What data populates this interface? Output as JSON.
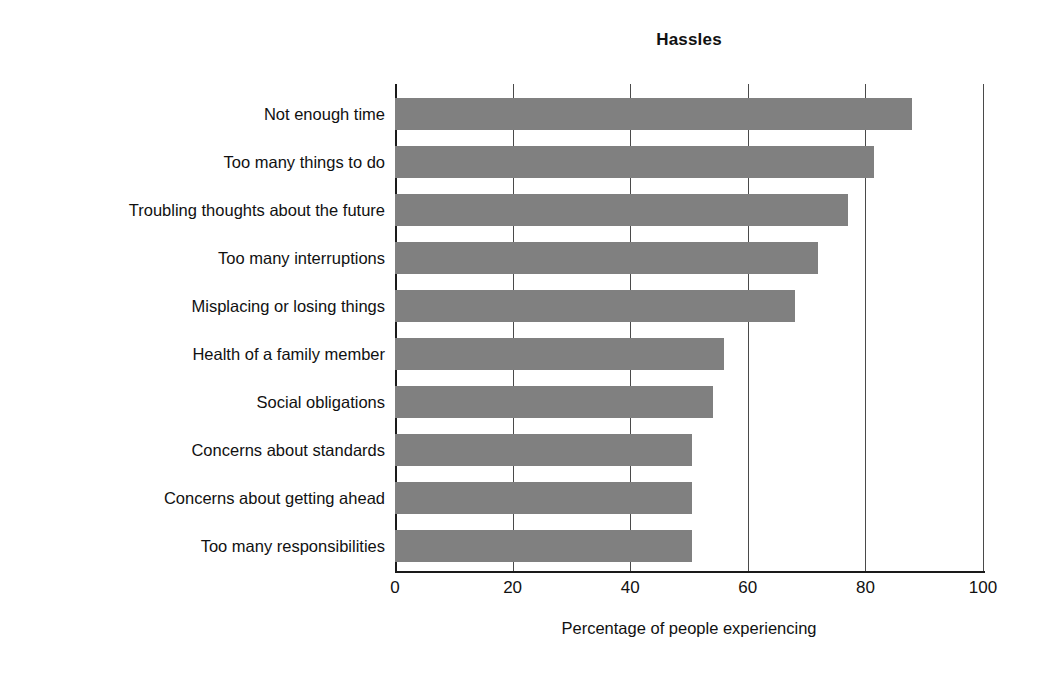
{
  "chart_data": {
    "type": "bar",
    "orientation": "horizontal",
    "title": "Hassles",
    "xlabel": "Percentage of people experiencing",
    "ylabel": "",
    "xlim": [
      0,
      100
    ],
    "xticks": [
      "0",
      "20",
      "40",
      "60",
      "80",
      "100"
    ],
    "grid": true,
    "legend": null,
    "bar_color": "#808080",
    "categories": [
      "Not enough time",
      "Too many things to do",
      "Troubling thoughts about the future",
      "Too many interruptions",
      "Misplacing or losing things",
      "Health of a family member",
      "Social obligations",
      "Concerns about standards",
      "Concerns about getting ahead",
      "Too many responsibilities"
    ],
    "values": [
      88,
      81.5,
      77,
      72,
      68,
      56,
      54,
      50.5,
      50.5,
      50.5
    ]
  }
}
